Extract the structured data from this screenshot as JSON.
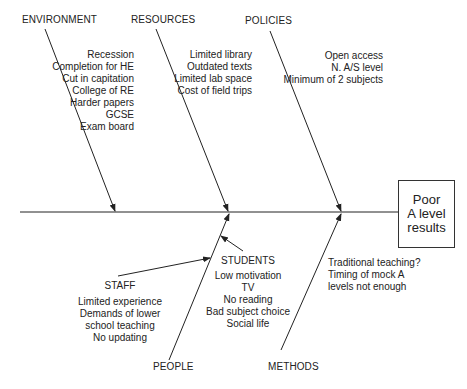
{
  "effect": [
    "Poor",
    "A level",
    "results"
  ],
  "categories": {
    "environment": {
      "label": "ENVIRONMENT",
      "causes": [
        "Recession",
        "Completion for HE",
        "Cut in capitation",
        "College of RE",
        "Harder papers",
        "GCSE",
        "Exam board"
      ]
    },
    "resources": {
      "label": "RESOURCES",
      "causes": [
        "Limited library",
        "Outdated texts",
        "Limited lab space",
        "Cost of field trips"
      ]
    },
    "policies": {
      "label": "POLICIES",
      "causes": [
        "Open access",
        "N. A/S level",
        "Minimum of 2 subjects"
      ]
    },
    "people": {
      "label": "PEOPLE",
      "sub": {
        "staff": {
          "label": "STAFF",
          "causes": [
            "Limited experience",
            "Demands of lower",
            "school teaching",
            "No updating"
          ]
        },
        "students": {
          "label": "STUDENTS",
          "causes": [
            "Low motivation",
            "TV",
            "No reading",
            "Bad subject choice",
            "Social life"
          ]
        }
      }
    },
    "methods": {
      "label": "METHODS",
      "causes": [
        "Traditional teaching?",
        "Timing of mock A",
        "levels not enough"
      ]
    }
  }
}
